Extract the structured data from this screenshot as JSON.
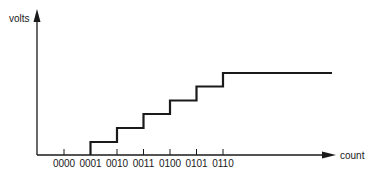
{
  "diagram": {
    "y_axis_label": "volts",
    "x_axis_label": "count",
    "tick_labels": [
      "0000",
      "0001",
      "0010",
      "0011",
      "0100",
      "0101",
      "0110"
    ],
    "step_levels": [
      0,
      1,
      2,
      3,
      4,
      5,
      6
    ],
    "colors": {
      "line": "#1a1a1a",
      "background": "#ffffff"
    }
  }
}
